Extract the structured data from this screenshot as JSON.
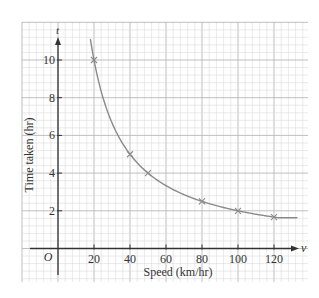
{
  "chart_data": {
    "type": "line",
    "title": "",
    "xlabel": "Speed (km/hr)",
    "ylabel": "Time taken (hr)",
    "x_axis_symbol": "v",
    "y_axis_symbol": "t",
    "origin_label": "O",
    "xlim": [
      -20,
      140
    ],
    "ylim": [
      -2,
      12
    ],
    "x_ticks": [
      20,
      40,
      60,
      80,
      100,
      120
    ],
    "y_ticks": [
      2,
      4,
      6,
      8,
      10
    ],
    "grid": true,
    "series": [
      {
        "name": "t = 200/v",
        "marker": "x",
        "points": [
          {
            "x": 20,
            "y": 10
          },
          {
            "x": 40,
            "y": 5
          },
          {
            "x": 50,
            "y": 4
          },
          {
            "x": 80,
            "y": 2.5
          },
          {
            "x": 100,
            "y": 2
          },
          {
            "x": 120,
            "y": 1.67
          }
        ]
      }
    ],
    "curve_range": [
      18,
      133
    ]
  },
  "colors": {
    "minor_grid": "#dcdcdc",
    "major_grid": "#b8b8b8",
    "axis": "#333333",
    "curve": "#8a8a8a",
    "marker": "#8a8a8a"
  }
}
